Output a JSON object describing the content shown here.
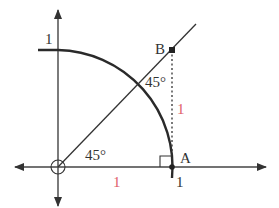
{
  "diagram": {
    "colors": {
      "stroke": "#333333",
      "accent": "#e0606a",
      "background": "#ffffff"
    },
    "labels": {
      "y_axis_one": "1",
      "point_b": "B",
      "point_a": "A",
      "angle_top": "45°",
      "angle_origin": "45°",
      "segment_ab_length": "1",
      "segment_oa_length": "1",
      "x_axis_one": "1"
    },
    "elements": [
      "x-axis with arrows both ends",
      "y-axis with arrows both ends",
      "quarter arc of unit circle",
      "line from origin through B at 45°",
      "dotted vertical segment from B to A",
      "right angle marker at A",
      "origin circle marker"
    ]
  }
}
